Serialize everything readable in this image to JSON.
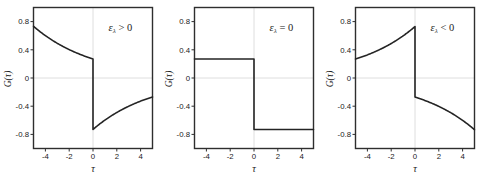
{
  "figure": {
    "style": {
      "background": "#ffffff",
      "axis_color": "#2e2e2e",
      "line_color": "#242424",
      "grid_color": "#dedede",
      "text_color": "#222222"
    }
  },
  "chart_data": [
    {
      "id": "epsilon-positive",
      "type": "line",
      "annotation": {
        "symbol": "ε",
        "subscript": "λ",
        "relation": ">",
        "value": "0"
      },
      "xlabel": "τ",
      "ylabel": "𝒢(τ)",
      "xlim": [
        -5,
        5
      ],
      "ylim": [
        -1,
        1
      ],
      "xticks": [
        -4,
        -2,
        0,
        2,
        4
      ],
      "yticks": [
        0.8,
        0.4,
        0,
        -0.4,
        -0.8
      ],
      "grid_zero_lines": true,
      "discontinuity_at": 0,
      "segments": [
        {
          "tau_start": -5,
          "tau_end": 0,
          "amplitude": 0.27,
          "decay_rate": 0.2,
          "endpoints": [
            0.73,
            0.27
          ]
        },
        {
          "tau_start": 0,
          "tau_end": 5,
          "amplitude": -0.73,
          "decay_rate": 0.2,
          "endpoints": [
            -0.73,
            -0.27
          ]
        }
      ]
    },
    {
      "id": "epsilon-zero",
      "type": "line",
      "annotation": {
        "symbol": "ε",
        "subscript": "λ",
        "relation": "=",
        "value": "0"
      },
      "xlabel": "τ",
      "ylabel": "𝒢(τ)",
      "xlim": [
        -5,
        5
      ],
      "ylim": [
        -1,
        1
      ],
      "xticks": [
        -4,
        -2,
        0,
        2,
        4
      ],
      "yticks": [
        0.8,
        0.4,
        0,
        -0.4,
        -0.8
      ],
      "grid_zero_lines": true,
      "discontinuity_at": 0,
      "segments": [
        {
          "tau_start": -5,
          "tau_end": 0,
          "amplitude": 0.27,
          "decay_rate": 0,
          "endpoints": [
            0.27,
            0.27
          ]
        },
        {
          "tau_start": 0,
          "tau_end": 5,
          "amplitude": -0.73,
          "decay_rate": 0,
          "endpoints": [
            -0.73,
            -0.73
          ]
        }
      ]
    },
    {
      "id": "epsilon-negative",
      "type": "line",
      "annotation": {
        "symbol": "ε",
        "subscript": "λ",
        "relation": "<",
        "value": "0"
      },
      "xlabel": "τ",
      "ylabel": "𝒢(τ)",
      "xlim": [
        -5,
        5
      ],
      "ylim": [
        -1,
        1
      ],
      "xticks": [
        -4,
        -2,
        0,
        2,
        4
      ],
      "yticks": [
        0.8,
        0.4,
        0,
        -0.4,
        -0.8
      ],
      "grid_zero_lines": true,
      "discontinuity_at": 0,
      "segments": [
        {
          "tau_start": -5,
          "tau_end": 0,
          "amplitude": 0.73,
          "decay_rate": -0.2,
          "endpoints": [
            0.27,
            0.73
          ]
        },
        {
          "tau_start": 0,
          "tau_end": 5,
          "amplitude": -0.27,
          "decay_rate": -0.2,
          "endpoints": [
            -0.27,
            -0.73
          ]
        }
      ]
    }
  ]
}
